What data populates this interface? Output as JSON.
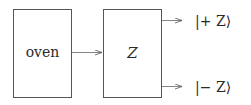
{
  "diagram": {
    "type": "Stern-Gerlach schematic",
    "boxes": [
      {
        "id": "oven",
        "label": "oven"
      },
      {
        "id": "z-analyzer",
        "label": "Z"
      }
    ],
    "outputs": [
      {
        "id": "plus-z",
        "label": "|+ Z⟩"
      },
      {
        "id": "minus-z",
        "label": "|− Z⟩"
      }
    ],
    "colors": {
      "stroke": "#444444",
      "text": "#2a2a2a",
      "background": "#ffffff"
    }
  }
}
